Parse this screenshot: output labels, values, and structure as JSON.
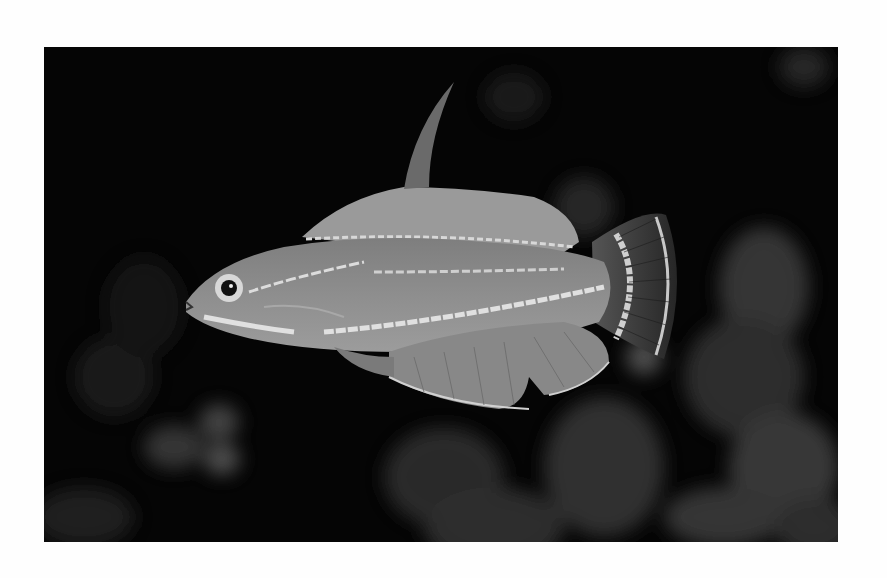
{
  "image": {
    "subject": "flasher wrasse fish",
    "description": "Grayscale photograph of a wrasse with elongated dorsal spine, striped body and fan tail against a dark blurred reef background",
    "colors": {
      "page_background": "#fefefe",
      "photo_background": "#050505",
      "fish_body": "#8a8a8a",
      "fish_highlight": "#d8d8d8",
      "fin_dark": "#3a3a3a",
      "bokeh": "#3c3c3c"
    }
  }
}
